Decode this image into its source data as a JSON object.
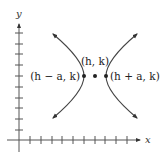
{
  "diagram": {
    "type": "hyperbola-horizontal-transverse-axis",
    "axes": {
      "x_label": "x",
      "y_label": "y",
      "x_tick_count": 10,
      "y_tick_count": 10
    },
    "points": [
      {
        "id": "left-vertex",
        "label": "(h − a, k)"
      },
      {
        "id": "center",
        "label": "(h, k)"
      },
      {
        "id": "right-vertex",
        "label": "(h + a, k)"
      }
    ],
    "colors": {
      "stroke": "#444444",
      "text": "#222222",
      "background": "#ffffff"
    }
  }
}
